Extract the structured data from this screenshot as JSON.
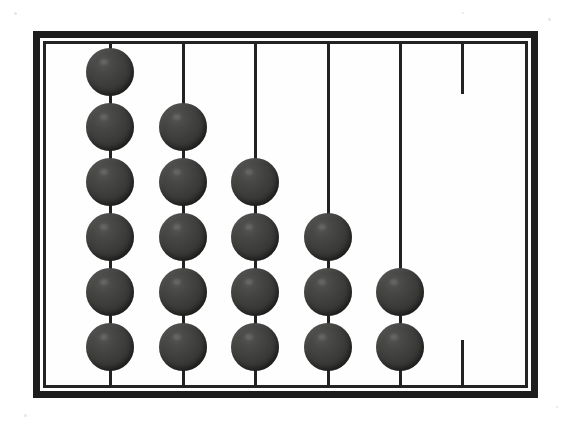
{
  "scene": {
    "title": "Abacus",
    "description": "Counting frame with five strung rods and one empty rod",
    "background_color": "#ffffff",
    "bead_color": "#3a3a3a",
    "frame_color": "#1d1d1d",
    "rod_color": "#222222",
    "interior_color": "#fefefe"
  },
  "frame": {
    "x": 33,
    "y": 31,
    "width": 505,
    "height": 367,
    "outer_border_width": 7,
    "gap_width": 3,
    "inner_border_width": 3
  },
  "chart_data": {
    "type": "bar",
    "xlabel": "Rod",
    "ylabel": "Beads",
    "categories": [
      "Rod 1",
      "Rod 2",
      "Rod 3",
      "Rod 4",
      "Rod 5",
      "Rod 6"
    ],
    "values": [
      6,
      5,
      4,
      3,
      2,
      0
    ],
    "ylim": [
      0,
      6
    ],
    "grid": false,
    "legend": null,
    "total_beads": 20
  },
  "rods": [
    {
      "name": "rod-1",
      "x": 110,
      "beads": 6,
      "top_y": 40,
      "bottom_y": 390,
      "empty": false,
      "stub_only": false
    },
    {
      "name": "rod-2",
      "x": 183,
      "beads": 5,
      "top_y": 40,
      "bottom_y": 390,
      "empty": false,
      "stub_only": false
    },
    {
      "name": "rod-3",
      "x": 255,
      "beads": 4,
      "top_y": 40,
      "bottom_y": 390,
      "empty": false,
      "stub_only": false
    },
    {
      "name": "rod-4",
      "x": 328,
      "beads": 3,
      "top_y": 40,
      "bottom_y": 390,
      "empty": false,
      "stub_only": false
    },
    {
      "name": "rod-5",
      "x": 400,
      "beads": 2,
      "top_y": 40,
      "bottom_y": 390,
      "empty": false,
      "stub_only": false
    },
    {
      "name": "rod-6",
      "x": 462,
      "beads": 0,
      "top_y": 40,
      "bottom_y": 390,
      "empty": true,
      "stub_only": true,
      "top_stub_height": 50,
      "bottom_stub_height": 45
    }
  ],
  "bead_geometry": {
    "diameter": 48,
    "bottom_center_y": 347,
    "vertical_spacing": 55
  },
  "specks": [
    {
      "x": 14,
      "y": 12,
      "size": 3
    },
    {
      "x": 548,
      "y": 18,
      "size": 3
    },
    {
      "x": 24,
      "y": 414,
      "size": 3
    },
    {
      "x": 556,
      "y": 406,
      "size": 2
    },
    {
      "x": 290,
      "y": 392,
      "size": 2
    },
    {
      "x": 462,
      "y": 12,
      "size": 2
    }
  ]
}
